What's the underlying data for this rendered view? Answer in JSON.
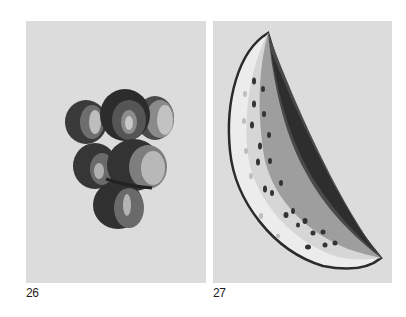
{
  "plates": [
    {
      "number": "26",
      "subject": "grape-cluster",
      "background": "#dcdcdc"
    },
    {
      "number": "27",
      "subject": "watermelon-slice",
      "background": "#dcdcdc"
    }
  ],
  "colors": {
    "page": "#ffffff",
    "dark": "#2e2e2e",
    "mid": "#5a5a5a",
    "light": "#9a9a9a",
    "highlight": "#c4c4c4",
    "rind": "#e8e8e8"
  }
}
